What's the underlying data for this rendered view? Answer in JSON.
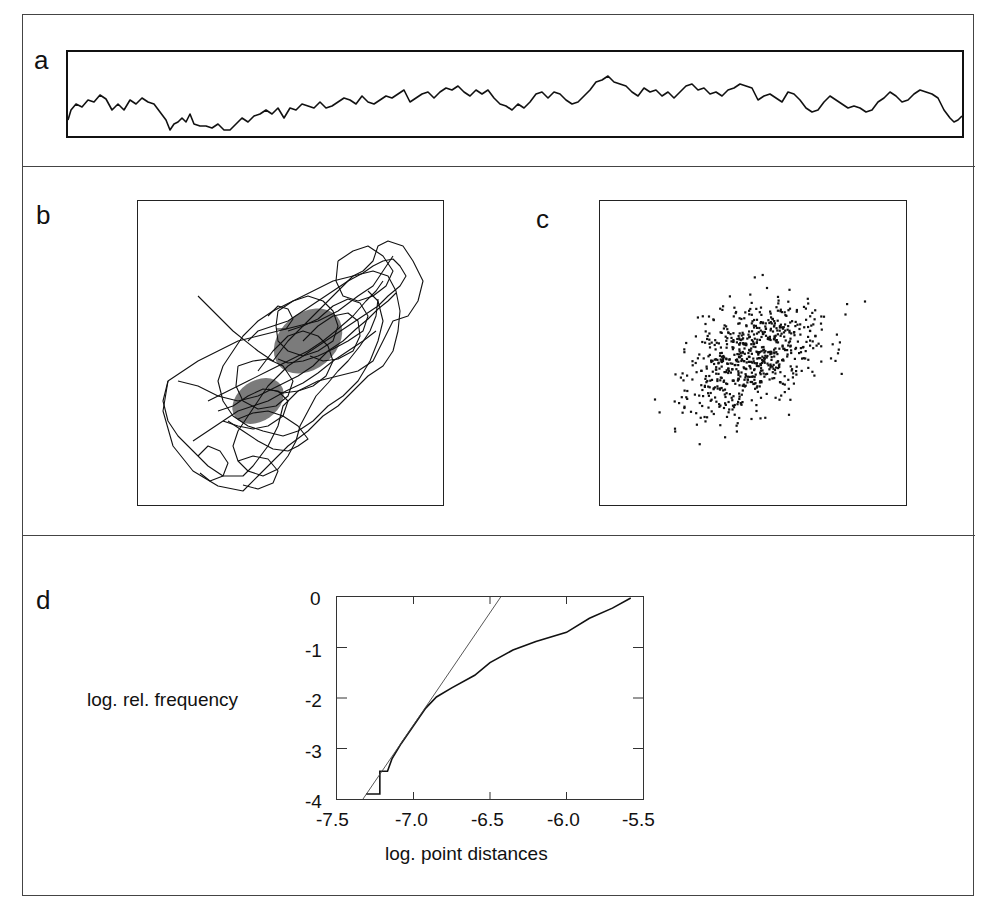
{
  "figure": {
    "panels": {
      "a": {
        "label": "a",
        "description": "time series trace"
      },
      "b": {
        "label": "b",
        "description": "phase-space trajectory (connected)"
      },
      "c": {
        "label": "c",
        "description": "phase-space point cloud"
      },
      "d": {
        "label": "d",
        "description": "correlation integral plot"
      }
    }
  },
  "chart_data": [
    {
      "panel": "a",
      "type": "line",
      "title": "",
      "xlabel": "",
      "ylabel": "",
      "grid": false,
      "note": "noisy random-walk-like signal, no axis ticks",
      "x": [
        0,
        0.02,
        0.05,
        0.08,
        0.1,
        0.13,
        0.16,
        0.2,
        0.23,
        0.27,
        0.3,
        0.33,
        0.36,
        0.4,
        0.43,
        0.47,
        0.5,
        0.53,
        0.56,
        0.6,
        0.63,
        0.67,
        0.7,
        0.73,
        0.76,
        0.8,
        0.83,
        0.86,
        0.9,
        0.93,
        0.96,
        0.98,
        1.0
      ],
      "values": [
        0.35,
        0.55,
        0.6,
        0.6,
        0.25,
        0.45,
        0.25,
        0.48,
        0.58,
        0.55,
        0.48,
        0.6,
        0.65,
        0.5,
        0.8,
        0.65,
        0.58,
        0.72,
        0.7,
        0.72,
        0.55,
        0.7,
        0.72,
        0.45,
        0.58,
        0.55,
        0.45,
        0.32,
        0.5,
        0.4,
        0.65,
        0.1,
        0.15
      ]
    },
    {
      "panel": "b",
      "type": "line",
      "title": "",
      "xlabel": "",
      "ylabel": "",
      "grid": false,
      "note": "tangled trajectory elongated along diagonal from lower-left to upper-right, no axis ticks"
    },
    {
      "panel": "c",
      "type": "scatter",
      "title": "",
      "xlabel": "",
      "ylabel": "",
      "grid": false,
      "note": "dense elliptical point cloud elongated from lower-left to upper-right, no axis ticks"
    },
    {
      "panel": "d",
      "type": "line",
      "title": "",
      "xlabel": "log. point distances",
      "ylabel": "log. rel. frequency",
      "xlim": [
        -7.5,
        -5.5
      ],
      "ylim": [
        -4,
        0
      ],
      "xticks": [
        "-7.5",
        "-7.0",
        "-6.5",
        "-6.0",
        "-5.5"
      ],
      "yticks": [
        "0",
        "-1",
        "-2",
        "-3",
        "-4"
      ],
      "grid": false,
      "series": [
        {
          "name": "empirical curve",
          "x": [
            -7.31,
            -7.22,
            -7.22,
            -7.17,
            -7.14,
            -7.08,
            -7.0,
            -6.92,
            -6.85,
            -6.75,
            -6.6,
            -6.5,
            -6.35,
            -6.2,
            -6.0,
            -5.85,
            -5.7,
            -5.58
          ],
          "y": [
            -3.9,
            -3.9,
            -3.45,
            -3.45,
            -3.2,
            -2.9,
            -2.55,
            -2.2,
            -1.98,
            -1.8,
            -1.55,
            -1.3,
            -1.05,
            -0.88,
            -0.7,
            -0.42,
            -0.22,
            -0.02
          ]
        },
        {
          "name": "fitted line",
          "x": [
            -7.33,
            -6.43
          ],
          "y": [
            -4.0,
            0.0
          ]
        }
      ]
    }
  ]
}
